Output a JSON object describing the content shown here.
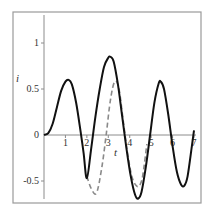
{
  "chart_data": {
    "type": "line",
    "title": "",
    "xlabel": "t",
    "ylabel": "i",
    "xlim": [
      0,
      7
    ],
    "ylim": [
      -0.7,
      1.3
    ],
    "grid": false,
    "legend": null,
    "x_ticks": [
      "1",
      "2",
      "3",
      "4",
      "5",
      "6",
      "7"
    ],
    "y_ticks": [
      "-0.5",
      "0",
      "0.5",
      "1"
    ],
    "series": [
      {
        "name": "solid",
        "style": "solid",
        "color": "#111111",
        "x": [
          0,
          0.2,
          0.4,
          0.6,
          0.8,
          1.0,
          1.15,
          1.3,
          1.5,
          1.7,
          1.85,
          2.0,
          2.2,
          2.4,
          2.6,
          2.8,
          3.0,
          3.1,
          3.25,
          3.45,
          3.65,
          3.85,
          4.05,
          4.25,
          4.4,
          4.55,
          4.75,
          4.95,
          5.15,
          5.35,
          5.45,
          5.6,
          5.8,
          6.0,
          6.2,
          6.4,
          6.55,
          6.7,
          6.9,
          7.0
        ],
        "y": [
          0,
          0.02,
          0.12,
          0.3,
          0.48,
          0.58,
          0.6,
          0.55,
          0.35,
          0.05,
          -0.2,
          -0.47,
          -0.15,
          0.2,
          0.5,
          0.74,
          0.84,
          0.85,
          0.8,
          0.55,
          0.2,
          -0.15,
          -0.45,
          -0.65,
          -0.69,
          -0.62,
          -0.35,
          0.0,
          0.35,
          0.56,
          0.58,
          0.5,
          0.22,
          -0.12,
          -0.4,
          -0.54,
          -0.55,
          -0.45,
          -0.12,
          0.05
        ]
      },
      {
        "name": "dashed",
        "style": "dashed",
        "color": "#8a8a8a",
        "x": [
          2.0,
          2.2,
          2.45,
          2.7,
          2.9,
          3.1,
          3.3,
          3.5,
          3.7,
          3.9,
          4.1,
          4.3,
          4.45,
          4.6,
          4.8
        ],
        "y": [
          -0.45,
          -0.58,
          -0.63,
          -0.35,
          0.0,
          0.38,
          0.58,
          0.5,
          0.15,
          -0.2,
          -0.45,
          -0.55,
          -0.55,
          -0.45,
          -0.1
        ]
      }
    ]
  },
  "labels": {
    "x_axis": "t",
    "y_axis": "i",
    "x_ticks": [
      "1",
      "2",
      "3",
      "4",
      "5",
      "6",
      "7"
    ],
    "y_ticks": {
      "one": "1",
      "half": "0.5",
      "zero": "0",
      "neg_half": "-0.5"
    }
  }
}
